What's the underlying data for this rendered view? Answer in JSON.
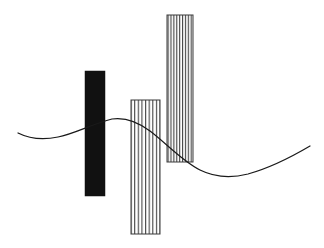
{
  "canvas": {
    "width": 324,
    "height": 248,
    "background_color": "#ffffff",
    "title": "Abstract Composition"
  },
  "chart_data": {
    "type": "bar",
    "title": "",
    "subtitle": "",
    "xlabel": "",
    "ylabel": "",
    "grid": false,
    "legend": false,
    "axes_visible": false,
    "tick_labels": [],
    "annotations": [],
    "xlim": [
      0,
      324
    ],
    "ylim": [
      0,
      248
    ],
    "categories": [
      "bar-1",
      "bar-2",
      "bar-3"
    ],
    "values": [
      125,
      134,
      147
    ],
    "series": [
      {
        "name": "vertical-bars",
        "values": [
          125,
          134,
          147
        ]
      }
    ],
    "overlay_series": [
      {
        "name": "sine-curve",
        "type": "line",
        "color": "#1a1a1a",
        "stroke_width": 1.2,
        "x": [
          18,
          30,
          45,
          60,
          75,
          90,
          105,
          118,
          130,
          145,
          160,
          175,
          190,
          205,
          220,
          235,
          250,
          265,
          280,
          295,
          310
        ],
        "y": [
          133,
          136,
          138,
          137,
          133,
          127,
          121,
          119,
          119,
          123,
          130,
          139,
          149,
          160,
          169,
          174,
          175,
          172,
          166,
          157,
          146
        ]
      }
    ]
  },
  "shapes": {
    "bars": [
      {
        "id": "bar-1",
        "name": "solid-black-bar",
        "fill_style": "solid",
        "fill_color": "#111111",
        "stroke_color": "#111111",
        "x": 85,
        "y": 71,
        "width": 20,
        "height": 125,
        "stripe_count": 0
      },
      {
        "id": "bar-2",
        "name": "hatched-bar-middle",
        "fill_style": "vertical-hatch",
        "fill_color": "#ffffff",
        "stroke_color": "#3a3a3a",
        "x": 131,
        "y": 100,
        "width": 29,
        "height": 134,
        "stripe_count": 8
      },
      {
        "id": "bar-3",
        "name": "hatched-bar-tall",
        "fill_style": "vertical-hatch",
        "fill_color": "#ffffff",
        "stroke_color": "#3a3a3a",
        "x": 167,
        "y": 15,
        "width": 26,
        "height": 147,
        "stripe_count": 9
      }
    ],
    "curve": {
      "id": "curve-1",
      "name": "sine-curve",
      "path": "M 18 133 C 30 139, 44 140, 58 137 C 74 134, 92 124, 112 119 C 126 117, 138 122, 150 131 C 166 143, 182 161, 200 170 C 216 178, 232 178, 248 174 C 266 169, 288 159, 310 146",
      "stroke_color": "#1a1a1a",
      "stroke_width": 1.2,
      "fill": "none"
    }
  }
}
